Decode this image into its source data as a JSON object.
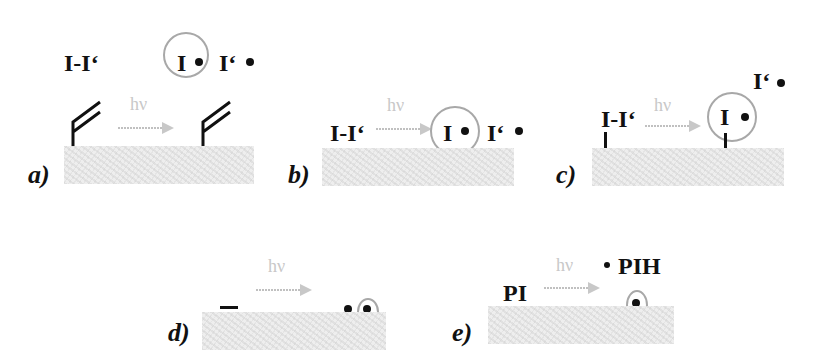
{
  "panels": {
    "a": {
      "label": "a)",
      "reactant": "I-I‘",
      "hv": "hν",
      "product_circled": "I",
      "product_free": "I‘"
    },
    "b": {
      "label": "b)",
      "reactant": "I-I‘",
      "hv": "hν",
      "product_circled": "I",
      "product_free": "I‘"
    },
    "c": {
      "label": "c)",
      "reactant": "I-I‘",
      "hv": "hν",
      "product_circled": "I",
      "product_free": "I‘"
    },
    "d": {
      "label": "d)",
      "hv": "hν"
    },
    "e": {
      "label": "e)",
      "reactant": "PI",
      "hv": "hν",
      "product_free": "PIH"
    }
  },
  "colors": {
    "arrow": "#c0c0c0",
    "circle": "#a8a8a8",
    "surface": "#eeeeee",
    "ink": "#111111"
  }
}
